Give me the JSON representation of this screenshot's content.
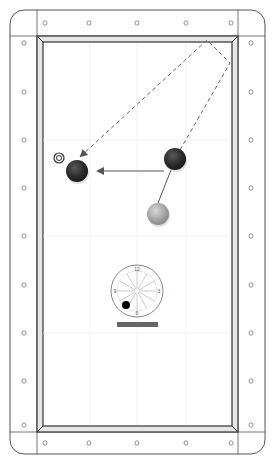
{
  "diagram": {
    "type": "pool-table-shot-diagram",
    "colors": {
      "rail_stroke": "#555555",
      "cushion_fill": "#e6e6e6",
      "cushion_stroke": "#333333",
      "felt": "#ffffff",
      "grid": "#eeeeee",
      "object_ball": "#2e2e2e",
      "object_ball_highlight": "#555555",
      "cue_ball": "#a8a8a8",
      "cue_ball_highlight": "#d4d4d4",
      "path_solid": "#555555",
      "path_dashed": "#666666",
      "clock_stroke": "#888888",
      "tip_dot": "#000000",
      "bar": "#666666"
    },
    "sights": {
      "top": [
        45,
        89,
        137,
        186,
        231
      ],
      "bottom": [
        45,
        89,
        137,
        186,
        231
      ],
      "left": [
        43,
        92,
        140,
        188,
        236,
        285,
        333,
        381,
        425
      ],
      "right": [
        43,
        92,
        140,
        188,
        236,
        285,
        333,
        381,
        425
      ],
      "glyph": "o"
    },
    "balls": [
      {
        "id": "object-ball-1",
        "x": 77,
        "y": 171,
        "r": 11,
        "kind": "object"
      },
      {
        "id": "object-ball-2",
        "x": 175,
        "y": 159,
        "r": 11,
        "kind": "object"
      },
      {
        "id": "cue-ball",
        "x": 158,
        "y": 214,
        "r": 11,
        "kind": "cue"
      }
    ],
    "target": {
      "x": 59,
      "y": 158,
      "r_outer": 5,
      "r_inner": 2.5
    },
    "paths": {
      "cue_to_ball2": {
        "x1": 158,
        "y1": 203,
        "x2": 171,
        "y2": 170
      },
      "ball2_to_ball1": {
        "x1": 164,
        "y1": 171,
        "x2": 98,
        "y2": 171
      },
      "dashed_bank": [
        [
          180,
          150
        ],
        [
          230,
          63
        ],
        [
          207,
          40
        ],
        [
          81,
          156
        ]
      ]
    },
    "clock": {
      "cx": 137,
      "cy": 291,
      "r": 26,
      "labels": {
        "top": "12",
        "right": "3",
        "bottom": "6",
        "left": "9"
      },
      "tip": {
        "x": 126,
        "y": 305,
        "r": 4
      },
      "bar": {
        "x": 117,
        "y": 322,
        "w": 41,
        "h": 5
      }
    }
  }
}
